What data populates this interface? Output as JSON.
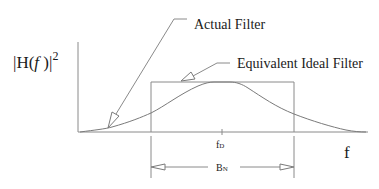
{
  "diagram": {
    "y_axis_label": {
      "prefix": "|H(",
      "var": "f",
      "suffix": " )|",
      "exponent": "2"
    },
    "x_axis_label": "f",
    "center_frequency_label": {
      "base": "f",
      "sub": "D"
    },
    "bandwidth_label": {
      "base": "B",
      "sub": "N"
    },
    "annotations": {
      "actual_filter": "Actual Filter",
      "equivalent_ideal_filter": "Equivalent Ideal Filter"
    },
    "colors": {
      "line": "#8a8a8a",
      "text": "#1a1a1a",
      "background": "#ffffff"
    }
  }
}
